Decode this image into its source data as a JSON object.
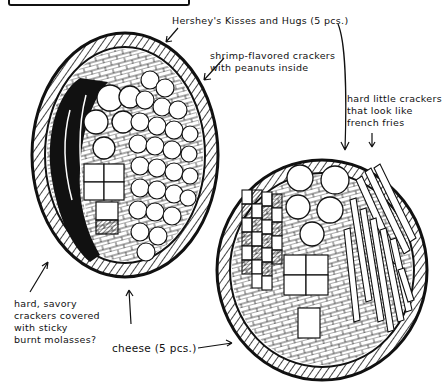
{
  "illustration": {
    "description": "Hand-drawn ink sketch of two oval snack trays with annotated contents",
    "labels": {
      "kisses": "Hershey's Kisses and Hugs (5 pcs.)",
      "shrimp": "shrimp-flavored crackers\nwith peanuts inside",
      "fries": "hard little crackers\nthat look like\nfrench fries",
      "molasses": "hard, savory\ncrackers covered\nwith sticky\nburnt molasses?",
      "cheese": "cheese (5 pcs.)"
    },
    "colors": {
      "ink": "#111111",
      "paper": "#ffffff"
    }
  }
}
